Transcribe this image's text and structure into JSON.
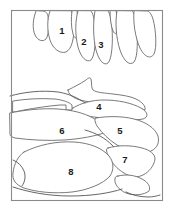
{
  "figure": {
    "width": 174,
    "height": 215,
    "background_color": "#ffffff",
    "line_color": "#6b6b6b",
    "frame_color": "#8a8a8a",
    "label_color": "#1a1a1a"
  },
  "labels": [
    {
      "id": "label-1",
      "text": "1",
      "x": 62,
      "y": 31
    },
    {
      "id": "label-2",
      "text": "2",
      "x": 84,
      "y": 42
    },
    {
      "id": "label-3",
      "text": "3",
      "x": 101,
      "y": 45
    },
    {
      "id": "label-4",
      "text": "4",
      "x": 99,
      "y": 107
    },
    {
      "id": "label-5",
      "text": "5",
      "x": 120,
      "y": 131
    },
    {
      "id": "label-6",
      "text": "6",
      "x": 62,
      "y": 131
    },
    {
      "id": "label-7",
      "text": "7",
      "x": 125,
      "y": 160
    },
    {
      "id": "label-8",
      "text": "8",
      "x": 71,
      "y": 172
    }
  ],
  "regions": [
    {
      "id": "region-1",
      "label": "1",
      "name": "upper-lobe-1"
    },
    {
      "id": "region-2",
      "label": "2",
      "name": "upper-lobe-2"
    },
    {
      "id": "region-3",
      "label": "3",
      "name": "upper-lobe-3"
    },
    {
      "id": "region-4",
      "label": "4",
      "name": "mid-region-4"
    },
    {
      "id": "region-5",
      "label": "5",
      "name": "mid-region-5"
    },
    {
      "id": "region-6",
      "label": "6",
      "name": "mid-region-6"
    },
    {
      "id": "region-7",
      "label": "7",
      "name": "lower-region-7"
    },
    {
      "id": "region-8",
      "label": "8",
      "name": "lower-region-8"
    }
  ]
}
